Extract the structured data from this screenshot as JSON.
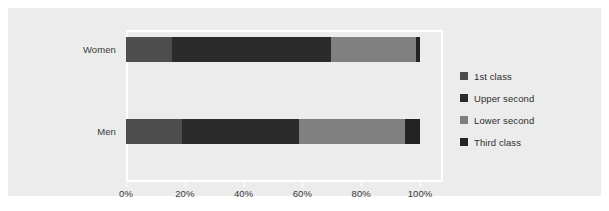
{
  "chart_data": {
    "type": "bar",
    "orientation": "horizontal",
    "stacked": true,
    "normalized": true,
    "title": "",
    "subtitle": "",
    "xlabel": "",
    "ylabel": "",
    "categories": [
      "Women",
      "Men"
    ],
    "xlim": [
      0,
      100
    ],
    "xticks": [
      0,
      20,
      40,
      60,
      80,
      100
    ],
    "xticklabels": [
      "0%",
      "20%",
      "40%",
      "60%",
      "80%",
      "100%"
    ],
    "grid": false,
    "legend_position": "right",
    "series": [
      {
        "name": "1st class",
        "color": "#4d4d4d",
        "values": [
          15.5,
          19.0
        ]
      },
      {
        "name": "Upper second",
        "color": "#2b2b2b",
        "values": [
          54.2,
          40.0
        ]
      },
      {
        "name": "Lower second",
        "color": "#808080",
        "values": [
          28.9,
          36.0
        ]
      },
      {
        "name": "Third class",
        "color": "#232323",
        "values": [
          1.4,
          5.0
        ]
      }
    ]
  },
  "legend": {
    "items": [
      {
        "label": "1st class",
        "color": "#4d4d4d"
      },
      {
        "label": "Upper second",
        "color": "#2b2b2b"
      },
      {
        "label": "Lower second",
        "color": "#808080"
      },
      {
        "label": "Third class",
        "color": "#232323"
      }
    ]
  },
  "axis": {
    "category_labels": [
      "Women",
      "Men"
    ],
    "tick_labels": [
      "0%",
      "20%",
      "40%",
      "60%",
      "80%",
      "100%"
    ]
  },
  "colors": {
    "figure_background": "#ffffff",
    "panel_background": "#ececec",
    "plot_border": "#ffffff",
    "tick_text": "#3a3a3a",
    "legend_text": "#2e2e2e"
  }
}
